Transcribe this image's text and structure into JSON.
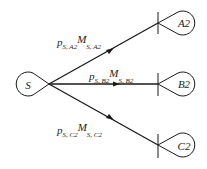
{
  "diagram": {
    "source": {
      "label": "S",
      "center": [
        29,
        84
      ],
      "tip": [
        49,
        84
      ]
    },
    "targets": [
      {
        "id": "A2",
        "label": "A2",
        "end": [
          158,
          23
        ],
        "center": [
          182,
          23
        ]
      },
      {
        "id": "B2",
        "label": "B2",
        "end": [
          158,
          84
        ],
        "center": [
          182,
          84
        ]
      },
      {
        "id": "C2",
        "label": "C2",
        "end": [
          158,
          145
        ],
        "center": [
          182,
          145
        ]
      }
    ],
    "edges": [
      {
        "from": "S",
        "to": "A2",
        "label": {
          "p": "p",
          "p_sub": "S, A2",
          "m": "M",
          "m_sub": "S, A2"
        }
      },
      {
        "from": "S",
        "to": "B2",
        "label": {
          "p": "p",
          "p_sub": "S, B2",
          "m": "M",
          "m_sub": "S, B2"
        }
      },
      {
        "from": "S",
        "to": "C2",
        "label": {
          "p": "p",
          "p_sub": "S, C2",
          "m": "M",
          "m_sub": "S, C2"
        }
      }
    ],
    "colors": {
      "stroke": "#1a1a1a",
      "text": "#222222",
      "background": "#ffffff"
    }
  }
}
